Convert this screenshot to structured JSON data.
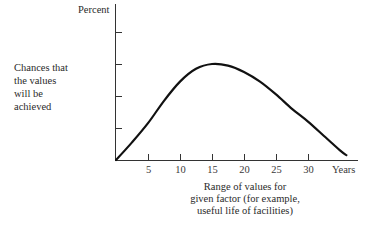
{
  "chart_data": {
    "type": "line",
    "title": "",
    "ylabel": "Percent",
    "ylabel_description": [
      "Chances that",
      "the values",
      "will be",
      "achieved"
    ],
    "xlabel": "Years",
    "xlabel_caption": [
      "Range of values for",
      "given factor (for example,",
      "useful life of facilities)"
    ],
    "x_ticks": [
      5,
      10,
      15,
      20,
      25,
      30
    ],
    "x_tick_labels": [
      "5",
      "10",
      "15",
      "20",
      "25",
      "30"
    ],
    "y_ticks_count": 4,
    "y_tick_labels": [],
    "xlim": [
      0,
      38
    ],
    "ylim": [
      0,
      5
    ],
    "grid": false,
    "legend": null,
    "series": [
      {
        "name": "Probability curve",
        "x": [
          0,
          2.5,
          5,
          7.5,
          10,
          12.5,
          15,
          17.5,
          20,
          22.5,
          25,
          27.5,
          30,
          32.5,
          35,
          36
        ],
        "y": [
          0,
          0.55,
          1.15,
          1.85,
          2.45,
          2.85,
          3.0,
          2.95,
          2.75,
          2.45,
          2.05,
          1.6,
          1.2,
          0.75,
          0.3,
          0.15
        ]
      }
    ],
    "annotations": [
      "Curve peaks near 15 years, skewed right, approaching zero near 36 years"
    ]
  },
  "labels": {
    "y_top": "Percent",
    "y_desc": [
      "Chances that",
      "the values",
      "will be",
      "achieved"
    ],
    "x_end": "Years",
    "caption": [
      "Range of values for",
      "given factor (for example,",
      "useful life of facilities)"
    ]
  }
}
